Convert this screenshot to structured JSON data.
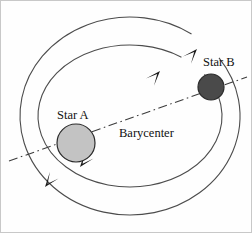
{
  "figure": {
    "background_color": "#fefefe",
    "border_color": "#c8c8c8",
    "width": 252,
    "height": 233
  },
  "labels": {
    "star_a": "Star A",
    "star_b": "Star B",
    "barycenter": "Barycenter"
  },
  "chart_data": {
    "type": "diagram",
    "bodies": [
      {
        "name": "Star A",
        "label": "Star A",
        "cx": 75,
        "cy": 142,
        "r": 19,
        "fill": "#c3c3c3",
        "stroke": "#2b2b2b",
        "relative_mass": "larger",
        "orbit": "inner"
      },
      {
        "name": "Star B",
        "label": "Star B",
        "cx": 210,
        "cy": 86,
        "r": 13,
        "fill": "#4a4a4a",
        "stroke": "#2b2b2b",
        "relative_mass": "smaller",
        "orbit": "outer"
      }
    ],
    "barycenter": {
      "label": "Barycenter",
      "x": 129,
      "y": 115,
      "label_x": 118,
      "label_y": 136
    },
    "orbits": [
      {
        "name": "inner-orbit",
        "cx": 129,
        "cy": 115,
        "rx": 92,
        "ry": 71,
        "stroke": "#4c4c4c",
        "style": "solid",
        "direction": "counterclockwise"
      },
      {
        "name": "outer-orbit",
        "cx": 129,
        "cy": 115,
        "rx": 110,
        "ry": 99,
        "stroke": "#4c4c4c",
        "style": "solid",
        "direction": "counterclockwise"
      }
    ],
    "axis": {
      "name": "barycenter-axis",
      "style": "dash-dot",
      "x1": 8,
      "y1": 160,
      "x2": 246,
      "y2": 76,
      "stroke": "#3c3c3c"
    },
    "direction_arrows": [
      {
        "name": "inner-orbit-arrow-upper-right",
        "x": 159,
        "y": 70,
        "angle": -48
      },
      {
        "name": "outer-orbit-arrow-upper-right",
        "x": 196,
        "y": 48,
        "angle": -48
      },
      {
        "name": "inner-orbit-arrow-lower-left",
        "x": 79,
        "y": 166,
        "angle": 128
      },
      {
        "name": "outer-orbit-arrow-lower-left",
        "x": 44,
        "y": 186,
        "angle": 128
      }
    ]
  }
}
